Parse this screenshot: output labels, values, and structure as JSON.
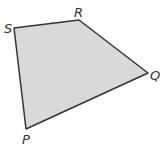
{
  "diagram": {
    "type": "quadrilateral",
    "fill_color": "#d9d9d9",
    "stroke_color": "#333333",
    "vertices": [
      {
        "label": "S",
        "x": 14,
        "y": 28,
        "lx": 4,
        "ly": 33
      },
      {
        "label": "R",
        "x": 79,
        "y": 20,
        "lx": 74,
        "ly": 17
      },
      {
        "label": "Q",
        "x": 148,
        "y": 73,
        "lx": 150,
        "ly": 80
      },
      {
        "label": "P",
        "x": 26,
        "y": 129,
        "lx": 22,
        "ly": 144
      }
    ]
  }
}
